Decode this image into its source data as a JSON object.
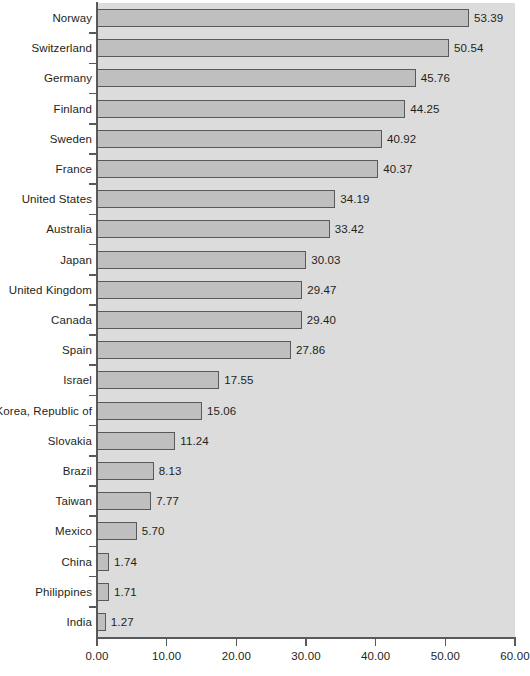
{
  "chart_data": {
    "type": "bar",
    "orientation": "horizontal",
    "title": "",
    "subtitle": "",
    "xlabel": "",
    "ylabel": "",
    "xlim": [
      0,
      60
    ],
    "ylim": null,
    "grid": false,
    "legend": null,
    "legend_position": "none",
    "xticks": [
      "0.00",
      "10.00",
      "20.00",
      "30.00",
      "40.00",
      "50.00",
      "60.00"
    ],
    "xtick_values": [
      0,
      10,
      20,
      30,
      40,
      50,
      60
    ],
    "categories": [
      "Norway",
      "Switzerland",
      "Germany",
      "Finland",
      "Sweden",
      "France",
      "United States",
      "Australia",
      "Japan",
      "United Kingdom",
      "Canada",
      "Spain",
      "Israel",
      "Korea, Republic of",
      "Slovakia",
      "Brazil",
      "Taiwan",
      "Mexico",
      "China",
      "Philippines",
      "India"
    ],
    "values": [
      53.39,
      50.54,
      45.76,
      44.25,
      40.92,
      40.37,
      34.19,
      33.42,
      30.03,
      29.47,
      29.4,
      27.86,
      17.55,
      15.06,
      11.24,
      8.13,
      7.77,
      5.7,
      1.74,
      1.71,
      1.27
    ],
    "value_labels": [
      "53.39",
      "50.54",
      "45.76",
      "44.25",
      "40.92",
      "40.37",
      "34.19",
      "33.42",
      "30.03",
      "29.47",
      "29.40",
      "27.86",
      "17.55",
      "15.06",
      "11.24",
      "8.13",
      "7.77",
      "5.70",
      "1.74",
      "1.71",
      "1.27"
    ],
    "colors": {
      "bar_fill": "#bfbfbf",
      "bar_border": "#58595b",
      "plot_background": "#dcdcdc",
      "axis": "#58595b",
      "text": "#231f20",
      "figure_background": "#ffffff"
    }
  }
}
